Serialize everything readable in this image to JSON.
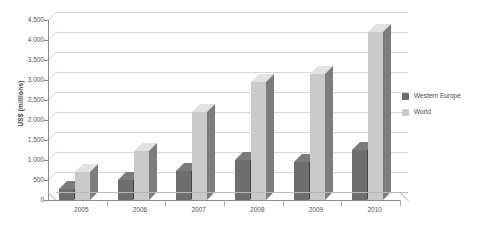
{
  "chart_data": {
    "type": "bar",
    "title": "",
    "subtitle": "",
    "xlabel": "",
    "ylabel": "US$ (millions)",
    "categories": [
      "2005",
      "2006",
      "2007",
      "2008",
      "2009",
      "2010"
    ],
    "series": [
      {
        "name": "Western Europe",
        "color": "#6e6e6e",
        "values": [
          280,
          490,
          720,
          990,
          960,
          1250
        ]
      },
      {
        "name": "World",
        "color": "#c9c9c9",
        "values": [
          700,
          1220,
          2200,
          2950,
          3150,
          4200
        ]
      }
    ],
    "ylim": [
      0,
      4500
    ],
    "yticks": [
      0,
      500,
      1000,
      1500,
      2000,
      2500,
      3000,
      3500,
      4000,
      4500
    ],
    "ytick_labels": [
      "0",
      "500",
      "1,000",
      "1,500",
      "2,000",
      "2,500",
      "3,000",
      "3,500",
      "4,000",
      "4,500"
    ],
    "grid": true,
    "legend_position": "right",
    "style": "3d-column",
    "background": "#ffffff",
    "grid_color": "#d8d8d8",
    "axis_color": "#8c8c8c",
    "text_color": "#555555"
  },
  "legend": {
    "entries": [
      {
        "label": "Western Europe",
        "color": "#6e6e6e"
      },
      {
        "label": "World",
        "color": "#c9c9c9"
      }
    ]
  }
}
